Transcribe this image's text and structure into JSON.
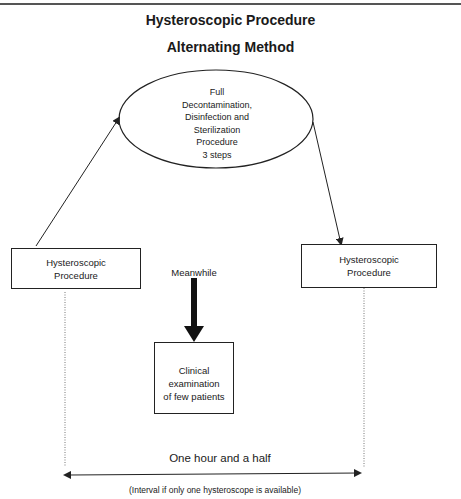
{
  "diagram": {
    "title": "Hysteroscopic Procedure",
    "subtitle": "Alternating Method",
    "nodes": {
      "sterilization": {
        "shape": "ellipse",
        "lines": [
          "Full",
          "Decontamination,",
          "Disinfection and",
          "Sterilization",
          "Procedure",
          "3 steps"
        ]
      },
      "left_procedure": {
        "shape": "rectangle",
        "lines": [
          "Hysteroscopic",
          "Procedure"
        ]
      },
      "right_procedure": {
        "shape": "rectangle",
        "lines": [
          "Hysteroscopic",
          "Procedure"
        ]
      },
      "clinical": {
        "shape": "rectangle",
        "lines": [
          "Clinical",
          "examination",
          "of few patients"
        ]
      }
    },
    "meanwhile_label": "Meanwhile",
    "interval_label": "One hour and a half",
    "interval_note": "(Interval if only one hysteroscope is available)",
    "edges": [
      {
        "from": "left_procedure",
        "to": "sterilization"
      },
      {
        "from": "sterilization",
        "to": "right_procedure"
      },
      {
        "from": "meanwhile",
        "to": "clinical",
        "style": "bold"
      }
    ]
  }
}
